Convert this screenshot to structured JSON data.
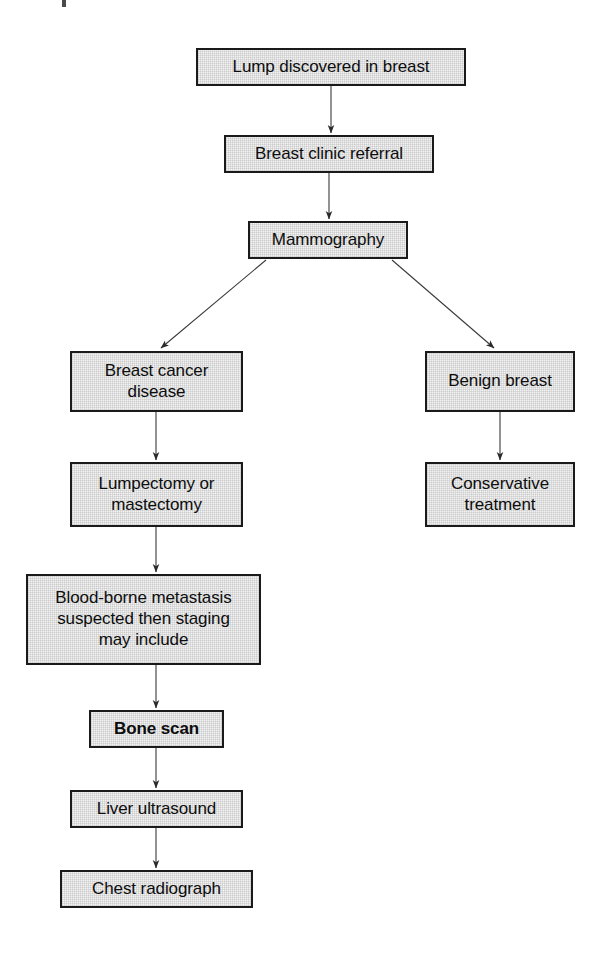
{
  "figure": {
    "kind": "clinical-pathway-flowchart",
    "box_fill_color": "#f2f2f2",
    "box_border_color": "#1a1a1a",
    "text_color": "#0d0d0d",
    "background_color": "#ffffff",
    "arrow_color": "#3a3a3a"
  },
  "nodes": [
    {
      "id": "lump-discovered",
      "label": "Lump discovered in breast",
      "bold": false,
      "x": 196,
      "y": 48,
      "w": 270,
      "h": 38
    },
    {
      "id": "breast-clinic-referral",
      "label": "Breast clinic referral",
      "bold": false,
      "x": 224,
      "y": 135,
      "w": 210,
      "h": 38
    },
    {
      "id": "mammography",
      "label": "Mammography",
      "bold": false,
      "x": 248,
      "y": 221,
      "w": 160,
      "h": 38
    },
    {
      "id": "breast-cancer-disease",
      "label": "Breast cancer\ndisease",
      "bold": false,
      "x": 70,
      "y": 351,
      "w": 173,
      "h": 61
    },
    {
      "id": "benign-breast",
      "label": "Benign breast",
      "bold": false,
      "x": 425,
      "y": 351,
      "w": 150,
      "h": 61
    },
    {
      "id": "lumpectomy-or-mastectomy",
      "label": "Lumpectomy or\nmastectomy",
      "bold": false,
      "x": 70,
      "y": 462,
      "w": 173,
      "h": 65
    },
    {
      "id": "conservative-treatment",
      "label": "Conservative\ntreatment",
      "bold": false,
      "x": 425,
      "y": 462,
      "w": 150,
      "h": 65
    },
    {
      "id": "blood-borne-metastasis",
      "label": "Blood-borne metastasis\nsuspected then staging\nmay include",
      "bold": false,
      "x": 26,
      "y": 574,
      "w": 235,
      "h": 91
    },
    {
      "id": "bone-scan",
      "label": "Bone scan",
      "bold": true,
      "x": 89,
      "y": 710,
      "w": 135,
      "h": 38
    },
    {
      "id": "liver-ultrasound",
      "label": "Liver ultrasound",
      "bold": false,
      "x": 70,
      "y": 790,
      "w": 173,
      "h": 38
    },
    {
      "id": "chest-radiograph",
      "label": "Chest radiograph",
      "bold": false,
      "x": 60,
      "y": 870,
      "w": 193,
      "h": 38
    }
  ],
  "edges": [
    {
      "id": "edge-lump-to-clinic",
      "from": "lump-discovered",
      "to": "breast-clinic-referral",
      "x1": 331,
      "y1": 86,
      "x2": 331,
      "y2": 133
    },
    {
      "id": "edge-clinic-to-mammography",
      "from": "breast-clinic-referral",
      "to": "mammography",
      "x1": 329,
      "y1": 173,
      "x2": 329,
      "y2": 219
    },
    {
      "id": "edge-mammography-to-cancer",
      "from": "mammography",
      "to": "breast-cancer-disease",
      "x1": 266,
      "y1": 260,
      "x2": 161,
      "y2": 348
    },
    {
      "id": "edge-mammography-to-benign",
      "from": "mammography",
      "to": "benign-breast",
      "x1": 392,
      "y1": 260,
      "x2": 494,
      "y2": 348
    },
    {
      "id": "edge-cancer-to-surgery",
      "from": "breast-cancer-disease",
      "to": "lumpectomy-or-mastectomy",
      "x1": 156,
      "y1": 412,
      "x2": 156,
      "y2": 460
    },
    {
      "id": "edge-benign-to-conservative",
      "from": "benign-breast",
      "to": "conservative-treatment",
      "x1": 500,
      "y1": 412,
      "x2": 500,
      "y2": 460
    },
    {
      "id": "edge-surgery-to-metastasis",
      "from": "lumpectomy-or-mastectomy",
      "to": "blood-borne-metastasis",
      "x1": 156,
      "y1": 527,
      "x2": 156,
      "y2": 572
    },
    {
      "id": "edge-metastasis-to-bone",
      "from": "blood-borne-metastasis",
      "to": "bone-scan",
      "x1": 156,
      "y1": 665,
      "x2": 156,
      "y2": 708
    },
    {
      "id": "edge-bone-to-liver",
      "from": "bone-scan",
      "to": "liver-ultrasound",
      "x1": 156,
      "y1": 748,
      "x2": 156,
      "y2": 788
    },
    {
      "id": "edge-liver-to-chest",
      "from": "liver-ultrasound",
      "to": "chest-radiograph",
      "x1": 156,
      "y1": 828,
      "x2": 156,
      "y2": 868
    }
  ]
}
